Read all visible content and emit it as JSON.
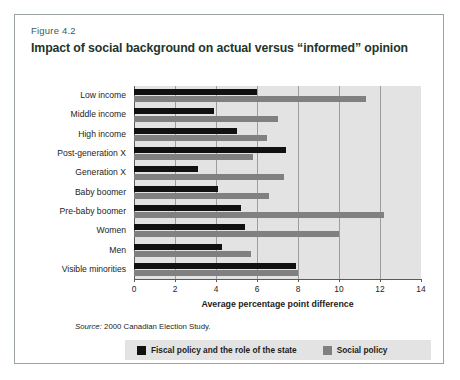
{
  "figure": {
    "number": "Figure 4.2",
    "title": "Impact of social background on actual versus “informed” opinion",
    "source_prefix": "Source:",
    "source_text": " 2000 Canadian Election Study."
  },
  "colors": {
    "fiscal": "#111111",
    "social": "#808080",
    "plot_background": "#e3e3e3",
    "gridline": "#9d9d9d",
    "axis": "#5a5a5a",
    "frame": "#9aa39c"
  },
  "legend": {
    "position": "bottom",
    "items": [
      {
        "label": "Fiscal policy and the role of the state",
        "color": "#111111"
      },
      {
        "label": "Social policy",
        "color": "#808080"
      }
    ]
  },
  "chart_data": {
    "type": "bar",
    "orientation": "horizontal",
    "title": "Impact of social background on actual versus “informed” opinion",
    "subtitle": "Figure 4.2",
    "xlabel": "Average percentage point difference",
    "ylabel": "",
    "xlim": [
      0,
      14
    ],
    "xticks": [
      0,
      2,
      4,
      6,
      8,
      10,
      12,
      14
    ],
    "xticklabels": [
      "0",
      "2",
      "4",
      "6",
      "8",
      "10",
      "12",
      "14"
    ],
    "grid": true,
    "grid_axis": "x",
    "legend_position": "bottom",
    "source": "2000 Canadian Election Study.",
    "categories": [
      "Low income",
      "Middle income",
      "High income",
      "Post-generation X",
      "Generation X",
      "Baby boomer",
      "Pre-baby boomer",
      "Women",
      "Men",
      "Visible minorities"
    ],
    "series": [
      {
        "name": "Fiscal policy and the role of the state",
        "color": "#111111",
        "values": [
          6.0,
          3.9,
          5.0,
          7.4,
          3.1,
          4.1,
          5.2,
          5.4,
          4.3,
          7.9
        ]
      },
      {
        "name": "Social policy",
        "color": "#808080",
        "values": [
          11.3,
          7.0,
          6.5,
          5.8,
          7.3,
          6.6,
          12.2,
          10.0,
          5.7,
          8.0
        ]
      }
    ]
  }
}
